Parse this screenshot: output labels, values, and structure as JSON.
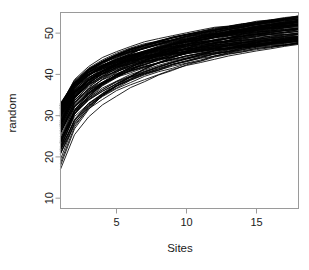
{
  "chart_data": {
    "type": "line",
    "title": "",
    "xlabel": "Sites",
    "ylabel": "random",
    "xlim": [
      1,
      18
    ],
    "ylim": [
      7.5,
      55
    ],
    "grid": false,
    "legend": null,
    "x": [
      1,
      2,
      3,
      4,
      5,
      6,
      7,
      8,
      9,
      10,
      11,
      12,
      13,
      14,
      15,
      16,
      17,
      18
    ],
    "xticks": [
      5,
      10,
      15
    ],
    "xtick_labels": [
      "5",
      "10",
      "15"
    ],
    "yticks": [
      10,
      20,
      30,
      40,
      50
    ],
    "ytick_labels": [
      "10",
      "20",
      "30",
      "40",
      "50"
    ],
    "n_series": 100,
    "series_description": "random species accumulation permutation curves",
    "series_color": "#000000",
    "start_value_range": [
      8.0,
      37.0
    ],
    "end_value_range": [
      44.8,
      54.2
    ],
    "mean_curve": [
      27.5,
      33.0,
      35.8,
      37.6,
      39.0,
      40.1,
      41.1,
      42.0,
      42.8,
      43.6,
      44.4,
      45.2,
      46.0,
      46.9,
      47.9,
      48.9,
      50.0,
      51.0
    ]
  },
  "axes": {
    "x_title": "Sites",
    "y_title": "random"
  }
}
